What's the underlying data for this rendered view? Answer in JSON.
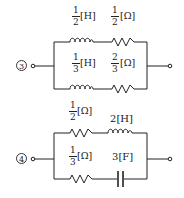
{
  "circuits": [
    {
      "label": "3",
      "top_branch": {
        "element1": {
          "type": "inductor",
          "num": "1",
          "den": "2",
          "unit": "[H]"
        },
        "element2": {
          "type": "resistor",
          "num": "1",
          "den": "2",
          "unit": "[Ω]"
        }
      },
      "bottom_branch": {
        "element1": {
          "type": "inductor",
          "num": "1",
          "den": "3",
          "unit": "[H]"
        },
        "element2": {
          "type": "resistor",
          "num": "2",
          "den": "3",
          "unit": "[Ω]"
        }
      }
    },
    {
      "label": "4",
      "top_branch": {
        "element1": {
          "type": "resistor",
          "num": "1",
          "den": "2",
          "unit": "[Ω]"
        },
        "element2": {
          "type": "inductor",
          "value": "2",
          "unit": "[H]"
        }
      },
      "bottom_branch": {
        "element1": {
          "type": "resistor",
          "num": "1",
          "den": "3",
          "unit": "[Ω]"
        },
        "element2": {
          "type": "capacitor",
          "value": "3",
          "unit": "[F]"
        }
      }
    }
  ]
}
